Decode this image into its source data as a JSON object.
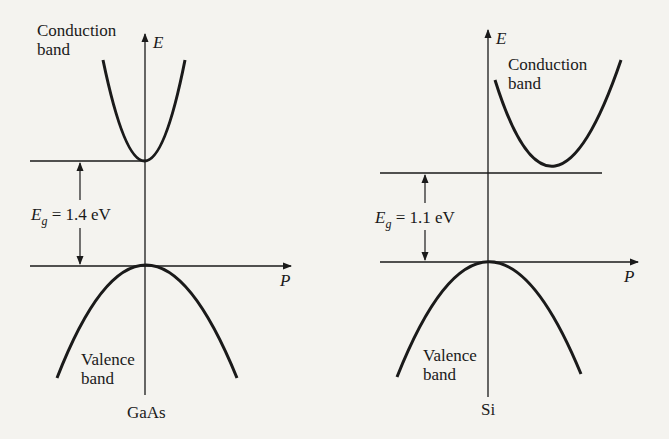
{
  "left": {
    "material": "GaAs",
    "axis_y": "E",
    "axis_x": "P",
    "conduction_label": [
      "Conduction",
      "band"
    ],
    "valence_label": [
      "Valence",
      "band"
    ],
    "gap": {
      "symbol": "E",
      "subscript": "g",
      "text": "= 1.4 eV"
    },
    "band_gap_type": "direct"
  },
  "right": {
    "material": "Si",
    "axis_y": "E",
    "axis_x": "P",
    "conduction_label": [
      "Conduction",
      "band"
    ],
    "valence_label": [
      "Valence",
      "band"
    ],
    "gap": {
      "symbol": "E",
      "subscript": "g",
      "text": "= 1.1 eV"
    },
    "band_gap_type": "indirect"
  },
  "colors": {
    "line": "#1a1a1a",
    "background": "#f4f3ef"
  }
}
